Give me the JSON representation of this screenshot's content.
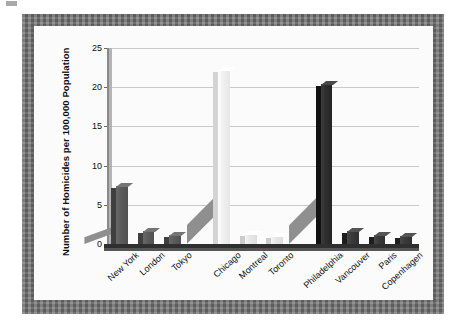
{
  "figure": {
    "frame_color": "#6f6f6f",
    "card_color": "#fbfbfb",
    "gridline_color": "#c9c9c9",
    "axis_color": "#8a8a8a"
  },
  "chart_data": {
    "type": "bar",
    "title": "",
    "subtitle": "",
    "xlabel": "",
    "ylabel": "Number of Homicides per 100,000 Population",
    "ylim": [
      0,
      25
    ],
    "ytick_labels": [
      "0",
      "5",
      "10",
      "15",
      "20",
      "25"
    ],
    "ytick_values": [
      0,
      5,
      10,
      15,
      20,
      25
    ],
    "grid": true,
    "legend": "none",
    "style": "3d-bar-grayscale",
    "categories": [
      "New York",
      "London",
      "Tokyo",
      "Chicago",
      "Montreal",
      "Toronto",
      "Philadelphia",
      "Vancouver",
      "Paris",
      "Copenhagen"
    ],
    "values": [
      7.4,
      1.7,
      1.1,
      22.2,
      1.3,
      1.0,
      20.4,
      1.6,
      1.2,
      1.0
    ],
    "bar_colors": [
      "#5b5b5b",
      "#5b5b5b",
      "#5b5b5b",
      "#f0f0f0",
      "#e7e7e7",
      "#e7e7e7",
      "#2e2e2e",
      "#3a3a3a",
      "#3a3a3a",
      "#3a3a3a"
    ],
    "group_gaps_after": [
      2,
      5
    ],
    "depth_wedges": [
      {
        "after_category": "New York",
        "top_value": 2.3
      },
      {
        "after_category": "Chicago",
        "top_value": 6.3
      },
      {
        "after_category": "Philadelphia",
        "top_value": 6.3
      }
    ]
  }
}
